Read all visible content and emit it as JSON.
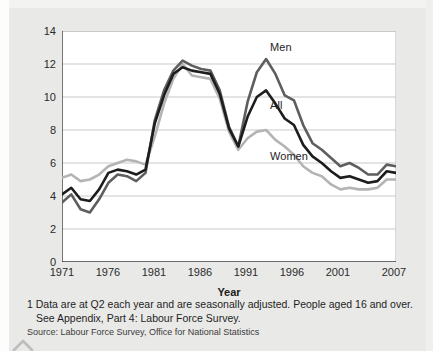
{
  "chart_data": {
    "type": "line",
    "title": "",
    "xlabel": "Year",
    "ylabel": "Percentages",
    "xlim": [
      1971,
      2007
    ],
    "ylim": [
      0,
      14
    ],
    "yticks": [
      0,
      2,
      4,
      6,
      8,
      10,
      12,
      14
    ],
    "xticks": [
      1971,
      1976,
      1981,
      1986,
      1991,
      1996,
      2001,
      2007
    ],
    "grid": "horizontal",
    "legend_position": "inline-annotations",
    "x": [
      1971,
      1972,
      1973,
      1974,
      1975,
      1976,
      1977,
      1978,
      1979,
      1980,
      1981,
      1982,
      1983,
      1984,
      1985,
      1986,
      1987,
      1988,
      1989,
      1990,
      1991,
      1992,
      1993,
      1994,
      1995,
      1996,
      1997,
      1998,
      1999,
      2000,
      2001,
      2002,
      2003,
      2004,
      2005,
      2006,
      2007
    ],
    "series": [
      {
        "name": "Men",
        "color": "#5e5e5e",
        "values": [
          3.6,
          4.1,
          3.2,
          3.0,
          3.8,
          4.8,
          5.3,
          5.2,
          4.9,
          5.4,
          8.6,
          10.4,
          11.6,
          12.2,
          11.9,
          11.7,
          11.6,
          10.4,
          8.2,
          7.0,
          9.7,
          11.5,
          12.3,
          11.4,
          10.1,
          9.8,
          8.3,
          7.2,
          6.8,
          6.3,
          5.8,
          6.0,
          5.7,
          5.3,
          5.3,
          5.9,
          5.8
        ]
      },
      {
        "name": "All",
        "color": "#1d1d1d",
        "values": [
          4.1,
          4.5,
          3.8,
          3.7,
          4.4,
          5.4,
          5.6,
          5.5,
          5.3,
          5.6,
          8.4,
          10.1,
          11.4,
          11.8,
          11.6,
          11.5,
          11.4,
          10.2,
          8.1,
          7.0,
          8.8,
          10.0,
          10.4,
          9.6,
          8.7,
          8.3,
          7.1,
          6.4,
          6.0,
          5.5,
          5.1,
          5.2,
          5.0,
          4.8,
          4.9,
          5.5,
          5.4
        ]
      },
      {
        "name": "Women",
        "color": "#b4b4b4",
        "values": [
          5.1,
          5.3,
          4.9,
          5.0,
          5.3,
          5.8,
          6.0,
          6.2,
          6.1,
          5.9,
          7.6,
          9.6,
          11.1,
          12.0,
          11.3,
          11.2,
          11.1,
          9.9,
          7.9,
          6.8,
          7.5,
          7.9,
          8.0,
          7.4,
          7.0,
          6.5,
          5.8,
          5.4,
          5.2,
          4.7,
          4.4,
          4.5,
          4.4,
          4.4,
          4.5,
          5.0,
          5.0
        ]
      }
    ],
    "annotations": [
      {
        "text": "Men",
        "x": 1993,
        "y": 12.9
      },
      {
        "text": "All",
        "x": 1993,
        "y": 9.4
      },
      {
        "text": "Women",
        "x": 1993,
        "y": 6.3
      }
    ]
  },
  "axes": {
    "y_label": "Percentages",
    "x_label": "Year",
    "y_ticks": [
      "0",
      "2",
      "4",
      "6",
      "8",
      "10",
      "12",
      "14"
    ],
    "x_ticks": [
      "1971",
      "1976",
      "1981",
      "1986",
      "1991",
      "1996",
      "2001",
      "2007"
    ]
  },
  "annotations": {
    "men": "Men",
    "all": "All",
    "women": "Women"
  },
  "footnote": {
    "line1": "1 Data are at Q2 each year and are seasonally adjusted. People aged 16 and over.",
    "line2": "See Appendix, Part 4: Labour Force Survey."
  },
  "source": {
    "text": "Source: Labour Force Survey, Office for National Statistics"
  },
  "colors": {
    "men": "#5e5e5e",
    "all": "#1d1d1d",
    "women": "#b4b4b4",
    "background": "#e9e9e7",
    "plot_background": "#ffffff",
    "gridline": "#c9c9c9"
  }
}
